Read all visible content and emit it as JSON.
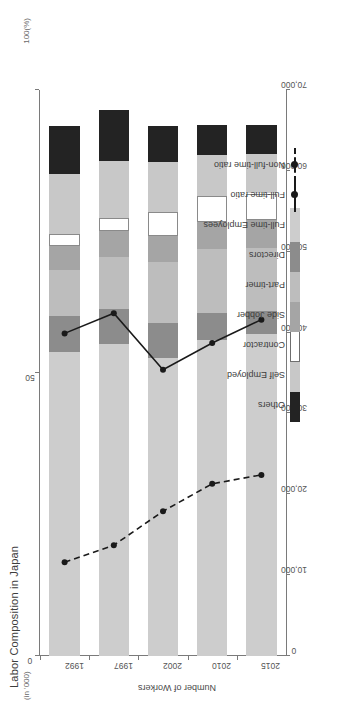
{
  "chart_data": {
    "type": "bar",
    "title": "Labor Composition in Japan",
    "xlabel": "",
    "ylabel": "Number of Workers",
    "unit_note": "(in '000)",
    "secondary_unit_note": "100(%)",
    "orientation": "horizontal-rotated",
    "categories": [
      "1992",
      "1997",
      "2002",
      "2010",
      "2015"
    ],
    "ylim": [
      0,
      70000
    ],
    "yticks": [
      0,
      10000,
      20000,
      30000,
      40000,
      50000,
      60000,
      70000
    ],
    "ytick_labels": [
      "0",
      "10,000",
      "20,000",
      "30,000",
      "40,000",
      "50,000",
      "60,000",
      "70,000"
    ],
    "secondary_ylim": [
      0,
      100
    ],
    "secondary_yticks": [
      0,
      50,
      100
    ],
    "secondary_ytick_labels": [
      "0",
      "50",
      "100(%)"
    ],
    "grid": false,
    "legend_position": "top-right",
    "stack_order": [
      "Full-time Employees",
      "Directors",
      "Part-timer",
      "Side Jobber",
      "Contractor",
      "Self Employed",
      "Others"
    ],
    "series": [
      {
        "name": "Full-time Employees",
        "color": "#cdcdcd",
        "values": [
          37600,
          38600,
          36800,
          39100,
          39800
        ]
      },
      {
        "name": "Directors",
        "color": "#8c8c8c",
        "values": [
          4400,
          4300,
          4400,
          3300,
          2900
        ]
      },
      {
        "name": "Part-timer",
        "color": "#bdbdbd",
        "values": [
          5700,
          6500,
          7500,
          7900,
          7700
        ]
      },
      {
        "name": "Side Jobber",
        "color": "#a5a5a5",
        "values": [
          3000,
          3200,
          3300,
          3400,
          3500
        ]
      },
      {
        "name": "Contractor",
        "color": "#ffffff",
        "values": [
          1500,
          1600,
          2900,
          3200,
          3300
        ]
      },
      {
        "name": "Self Employed",
        "color": "#c8c8c8",
        "values": [
          7400,
          7000,
          6200,
          5100,
          4900
        ]
      },
      {
        "name": "Others",
        "color": "#232323",
        "values": [
          5900,
          6300,
          4500,
          3700,
          3600
        ]
      }
    ],
    "lines": [
      {
        "name": "Full-time ratio",
        "style": "solid",
        "color": "#1a1a1a",
        "values": [
          39900,
          42400,
          35400,
          38700,
          41600
        ]
      },
      {
        "name": "Non-full-time ratio",
        "style": "dashed",
        "color": "#1a1a1a",
        "values": [
          11600,
          13700,
          17900,
          21300,
          22400
        ]
      }
    ]
  },
  "legend": {
    "items": [
      {
        "label": "Others",
        "kind": "swatch",
        "color": "#232323",
        "outlined": false
      },
      {
        "label": "Self Employed",
        "kind": "swatch",
        "color": "#c8c8c8",
        "outlined": false
      },
      {
        "label": "Contractor",
        "kind": "swatch",
        "color": "#ffffff",
        "outlined": true
      },
      {
        "label": "Side Jobber",
        "kind": "swatch",
        "color": "#a5a5a5",
        "outlined": false
      },
      {
        "label": "Part-timer",
        "kind": "swatch",
        "color": "#bdbdbd",
        "outlined": false
      },
      {
        "label": "Directors",
        "kind": "swatch",
        "color": "#8c8c8c",
        "outlined": false
      },
      {
        "label": "Full-time Employees",
        "kind": "swatch",
        "color": "#cdcdcd",
        "outlined": false
      },
      {
        "label": "Full-time ratio",
        "kind": "line-solid",
        "color": "#1a1a1a",
        "outlined": false
      },
      {
        "label": "Non-full-time ratio",
        "kind": "line-dashed",
        "color": "#1a1a1a",
        "outlined": false
      }
    ]
  }
}
